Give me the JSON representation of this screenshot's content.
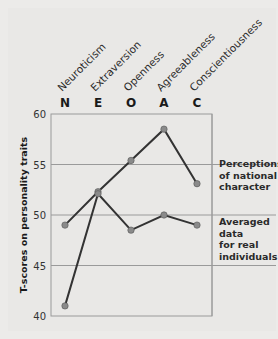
{
  "chart_data": {
    "type": "line",
    "title": "",
    "categories": [
      "N",
      "E",
      "O",
      "A",
      "C"
    ],
    "category_names": [
      "Neuroticism",
      "Extraversion",
      "Openness",
      "Agreeableness",
      "Conscientiousness"
    ],
    "series": [
      {
        "name": "Perceptions of national character",
        "values": [
          49,
          52.3,
          55.4,
          58.5,
          53.1
        ]
      },
      {
        "name": "Averaged data for real individuals",
        "values": [
          41,
          52.1,
          48.5,
          50,
          49
        ]
      }
    ],
    "xlabel": "",
    "ylabel": "T-scores on personality traits",
    "ylim": [
      40,
      60
    ],
    "yticks": [
      40,
      45,
      50,
      55,
      60
    ],
    "grid": true,
    "legend_position": "right (inline labels)"
  },
  "legend": {
    "perceptions": [
      "Perceptions",
      "of national",
      "character"
    ],
    "averaged": [
      "Averaged",
      "data",
      "for real",
      "individuals"
    ]
  },
  "colors": {
    "line": "#333333",
    "marker": "#8a8a8a",
    "grid": "#9a9a9a",
    "background": "#ebeae8"
  }
}
